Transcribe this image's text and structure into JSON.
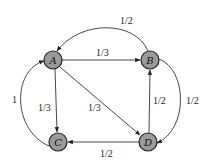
{
  "diagram": {
    "type": "directed-graph",
    "nodes": [
      {
        "id": "A",
        "label": "A"
      },
      {
        "id": "B",
        "label": "B"
      },
      {
        "id": "C",
        "label": "C"
      },
      {
        "id": "D",
        "label": "D"
      }
    ],
    "edges": [
      {
        "from": "A",
        "to": "B",
        "label": "1/3"
      },
      {
        "from": "A",
        "to": "C",
        "label": "1/3"
      },
      {
        "from": "A",
        "to": "D",
        "label": "1/3"
      },
      {
        "from": "B",
        "to": "A",
        "label": "1/2"
      },
      {
        "from": "B",
        "to": "D",
        "label": "1/2"
      },
      {
        "from": "C",
        "to": "A",
        "label": "1"
      },
      {
        "from": "D",
        "to": "B",
        "label": "1/2"
      },
      {
        "from": "D",
        "to": "C",
        "label": "1/2"
      }
    ],
    "colors": {
      "node_fill": "#9a9a9a",
      "node_stroke": "#222222",
      "edge": "#333333"
    }
  }
}
